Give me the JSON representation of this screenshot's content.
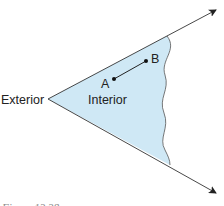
{
  "diagram": {
    "labels": {
      "exterior": "Exterior",
      "interior": "Interior",
      "point_a": "A",
      "point_b": "B"
    },
    "caption": "Figure 13.38",
    "colors": {
      "fill": "#cfe8f5",
      "stroke": "#333333"
    }
  }
}
